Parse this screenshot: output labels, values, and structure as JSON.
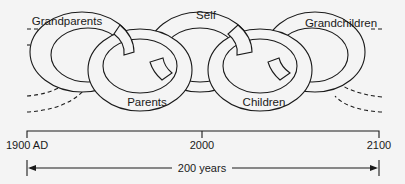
{
  "diagram": {
    "type": "interlocking-chain",
    "links": [
      {
        "label": "Grandparents",
        "position": "upper"
      },
      {
        "label": "Parents",
        "position": "lower"
      },
      {
        "label": "Self",
        "position": "upper"
      },
      {
        "label": "Children",
        "position": "lower"
      },
      {
        "label": "Grandchildren",
        "position": "upper"
      }
    ],
    "continuation": "dashed links extend off both ends"
  },
  "timeline": {
    "ticks": [
      "1900 AD",
      "2000",
      "2100"
    ],
    "span_label": "200 years"
  },
  "colors": {
    "line": "#1a1a1a",
    "background": "#f4f4f4"
  }
}
